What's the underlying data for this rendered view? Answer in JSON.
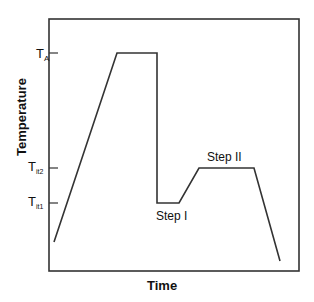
{
  "chart_data": {
    "type": "line",
    "title": "",
    "xlabel": "Time",
    "ylabel": "Temperature",
    "grid": false,
    "legend": null,
    "y_ticks": [
      {
        "label": "T",
        "sub": "A",
        "pixel_y": 53
      },
      {
        "label": "T",
        "sub": "it2",
        "pixel_y": 168
      },
      {
        "label": "T",
        "sub": "it1",
        "pixel_y": 203
      }
    ],
    "series": [
      {
        "name": "heat treatment profile",
        "points": [
          {
            "x": 54,
            "y": 242
          },
          {
            "x": 117,
            "y": 53
          },
          {
            "x": 157,
            "y": 53
          },
          {
            "x": 157,
            "y": 203
          },
          {
            "x": 179,
            "y": 203
          },
          {
            "x": 199,
            "y": 168
          },
          {
            "x": 254,
            "y": 168
          },
          {
            "x": 280,
            "y": 261
          }
        ]
      }
    ],
    "annotations": [
      {
        "text": "Step I",
        "x": 156,
        "y": 220
      },
      {
        "text": "Step II",
        "x": 207,
        "y": 161
      }
    ]
  },
  "labels": {
    "xlabel": "Time",
    "ylabel": "Temperature",
    "tick_ta": "T",
    "tick_ta_sub": "A",
    "tick_it2": "T",
    "tick_it2_sub": "it2",
    "tick_it1": "T",
    "tick_it1_sub": "it1",
    "step1": "Step I",
    "step2": "Step II"
  }
}
